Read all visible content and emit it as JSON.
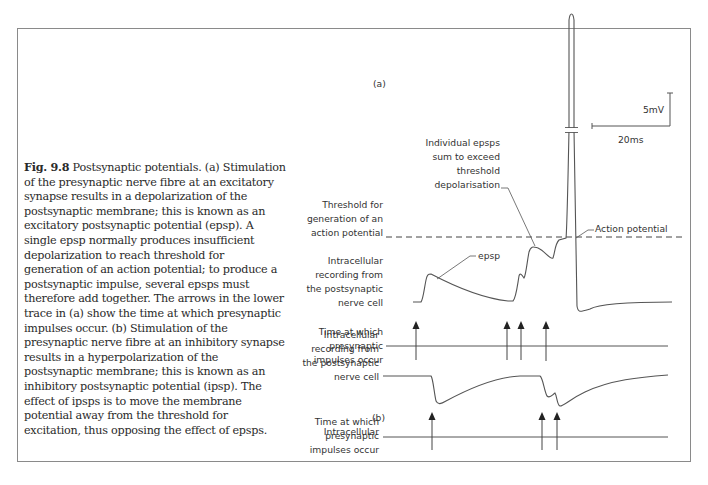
{
  "caption": {
    "figure_label": "Fig. 9.8",
    "text": "Postsynaptic potentials. (a) Stimulation of the presynaptic nerve fibre at an excitatory synapse results in a depolarization of the postsynaptic membrane; this is known as an excitatory postsynaptic potential (epsp). A single epsp normally produces insufficient depolarization to reach threshold for generation of an action potential; to produce a postsynaptic impulse, several epsps must therefore add together. The arrows in the lower trace in (a) show the time at which presynaptic impulses occur. (b) Stimulation of the presynaptic nerve fibre at an inhibitory synapse results in a hyperpolarization of the postsynaptic membrane; this is known as an inhibitory postsynaptic potential (ipsp). The effect of ipsps is to move the membrane potential away from the threshold for excitation, thus opposing the effect of epsps."
  },
  "panel_a": {
    "label": "(a)",
    "threshold_label": [
      "Threshold for",
      "generation of an",
      "action potential"
    ],
    "recording_label": [
      "Intracellular",
      "recording from",
      "the postsynaptic",
      "nerve cell"
    ],
    "time_label": [
      "Time at which",
      "presynaptic",
      "impulses occur"
    ],
    "epsp_label": "epsp",
    "sum_label": [
      "Individual epsps",
      "sum to exceed",
      "threshold",
      "depolarisation"
    ],
    "action_potential_label": "Action potential",
    "scale_voltage": "5mV",
    "scale_time": "20ms",
    "presynaptic_impulse_count": 4
  },
  "panel_b": {
    "label": "(b)",
    "recording_label": [
      "Intracellular",
      "recording from",
      "the postsynaptic",
      "nerve cell"
    ],
    "time_label": [
      "Time at which",
      "presynaptic",
      "impulses occur"
    ],
    "presynaptic_impulse_count": 3
  },
  "colors": {
    "trace": "#555555",
    "text": "#333333",
    "border": "#8a8a8a"
  }
}
